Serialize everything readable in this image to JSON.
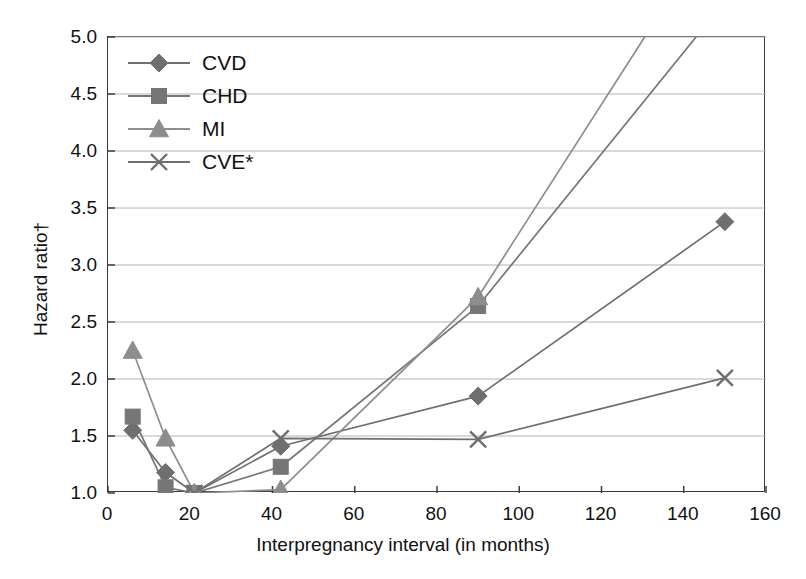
{
  "chart_data": {
    "type": "line",
    "title": "",
    "xlabel": "Interpregnancy interval (in months)",
    "ylabel": "Hazard ratio†",
    "xlim": [
      0,
      160
    ],
    "ylim": [
      1.0,
      5.0
    ],
    "xticks": [
      "0",
      "20",
      "40",
      "60",
      "80",
      "100",
      "120",
      "140",
      "160"
    ],
    "yticks": [
      "1.0",
      "1.5",
      "2.0",
      "2.5",
      "3.0",
      "3.5",
      "4.0",
      "4.5",
      "5.0"
    ],
    "grid": true,
    "legend_position": "top-left",
    "series": [
      {
        "name": "CVD",
        "marker": "diamond",
        "color": "#6f6f6f",
        "x": [
          6,
          14,
          21,
          42,
          90,
          150
        ],
        "values": [
          1.55,
          1.18,
          1.0,
          1.41,
          1.85,
          3.38
        ]
      },
      {
        "name": "CHD",
        "marker": "square",
        "color": "#767676",
        "x": [
          6,
          14,
          21,
          42,
          90,
          143
        ],
        "values": [
          1.67,
          1.05,
          1.0,
          1.23,
          2.64,
          5.0
        ]
      },
      {
        "name": "MI",
        "marker": "triangle",
        "color": "#8d8d8d",
        "x": [
          6,
          14,
          21,
          42,
          90,
          130.5
        ],
        "values": [
          2.25,
          1.48,
          1.0,
          1.03,
          2.72,
          5.0
        ]
      },
      {
        "name": "CVE*",
        "marker": "cross",
        "color": "#6f6f6f",
        "x": [
          21,
          42,
          90,
          150
        ],
        "values": [
          1.0,
          1.48,
          1.47,
          2.01
        ]
      }
    ]
  },
  "legend": {
    "items": [
      {
        "label": "CVD"
      },
      {
        "label": "CHD"
      },
      {
        "label": "MI"
      },
      {
        "label": "CVE*"
      }
    ]
  }
}
